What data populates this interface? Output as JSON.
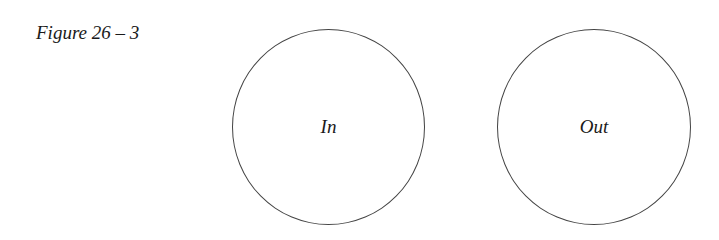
{
  "figure": {
    "caption": "Figure 26 – 3"
  },
  "circles": [
    {
      "label": "In"
    },
    {
      "label": "Out"
    }
  ]
}
